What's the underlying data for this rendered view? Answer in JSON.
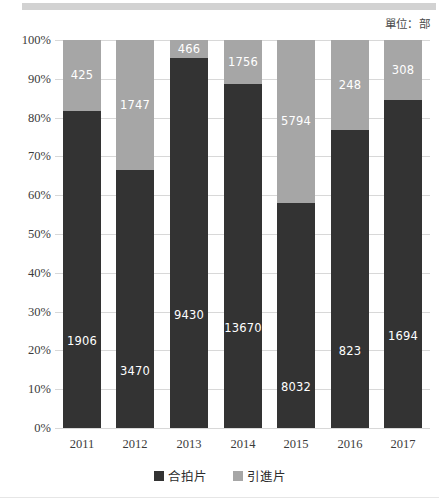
{
  "unit_note": "單位：部",
  "chart_data": {
    "type": "bar",
    "title": "",
    "subtitle": "",
    "xlabel": "",
    "ylabel": "",
    "stacked": true,
    "stack_mode": "percent",
    "grid": true,
    "legend_position": "bottom",
    "ylim": [
      0,
      100
    ],
    "ytick_labels": [
      "100%",
      "90%",
      "80%",
      "70%",
      "60%",
      "50%",
      "40%",
      "30%",
      "20%",
      "10%",
      "0%"
    ],
    "ytick_values": [
      100,
      90,
      80,
      70,
      60,
      50,
      40,
      30,
      20,
      10,
      0
    ],
    "categories": [
      "2011",
      "2012",
      "2013",
      "2014",
      "2015",
      "2016",
      "2017"
    ],
    "series": [
      {
        "name": "合拍片",
        "color": "#333333",
        "values": [
          1906,
          3470,
          9430,
          13670,
          8032,
          823,
          1694
        ],
        "percents": [
          81.8,
          66.5,
          95.3,
          88.6,
          58.1,
          76.8,
          84.6
        ]
      },
      {
        "name": "引進片",
        "color": "#a6a6a6",
        "values": [
          425,
          1747,
          466,
          1756,
          5794,
          248,
          308
        ],
        "percents": [
          18.2,
          33.5,
          4.7,
          11.4,
          41.9,
          23.2,
          15.4
        ]
      }
    ],
    "annotations": [
      "單位：部"
    ]
  },
  "legend": {
    "items": [
      {
        "label": "合拍片",
        "color": "#333333"
      },
      {
        "label": "引進片",
        "color": "#a6a6a6"
      }
    ]
  }
}
